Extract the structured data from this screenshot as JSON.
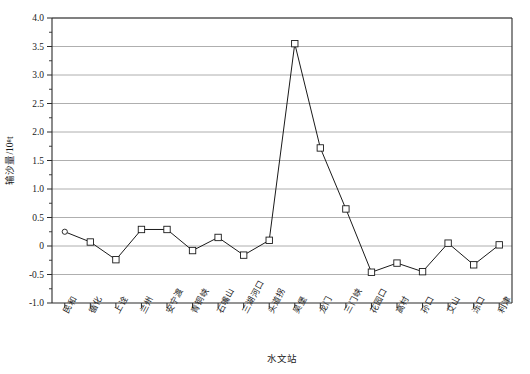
{
  "chart_data": {
    "type": "line",
    "title": "",
    "xlabel": "水文站",
    "ylabel": "输沙量/10⁸t",
    "ylim": [
      -1.0,
      4.0
    ],
    "grid": true,
    "legend": "none",
    "ytick_labels": [
      "4.0",
      "3.5",
      "3.0",
      "2.5",
      "2.0",
      "1.5",
      "1.0",
      "0.5",
      "0",
      "-0.5",
      "-1.0"
    ],
    "ytick_values": [
      4.0,
      3.5,
      3.0,
      2.5,
      2.0,
      1.5,
      1.0,
      0.5,
      0.0,
      -0.5,
      -1.0
    ],
    "categories": [
      "民和",
      "循化",
      "上诠",
      "兰州",
      "安宁渡",
      "青铜峡",
      "石嘴山",
      "三湖河口",
      "头道拐",
      "吴堡",
      "龙门",
      "三门峡",
      "花园口",
      "高村",
      "孙口",
      "艾山",
      "泺口",
      "利津"
    ],
    "values": [
      0.25,
      0.07,
      -0.24,
      0.29,
      0.29,
      -0.08,
      0.15,
      -0.16,
      0.1,
      3.55,
      1.72,
      0.65,
      -0.46,
      -0.3,
      -0.45,
      0.05,
      -0.33,
      0.02
    ],
    "marker": "open-square",
    "line_color": "#1a1a1a",
    "grid_color": "#9a9a9a"
  }
}
